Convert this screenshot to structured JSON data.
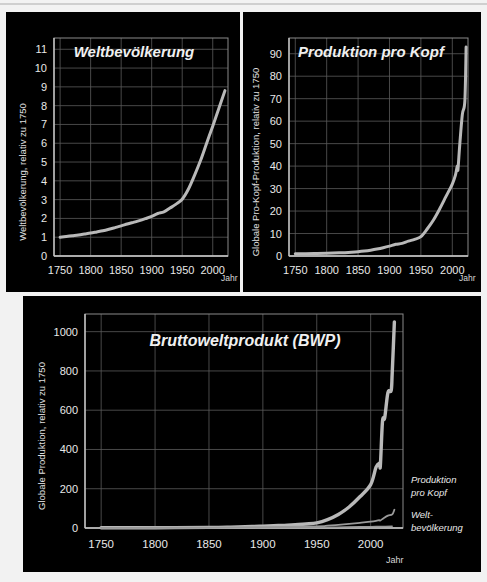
{
  "figure": {
    "background": "#f2f2f2",
    "panel_background": "#000000",
    "line_color": "#b9b9b9",
    "thin_line_color": "#9a9a9a",
    "grid_color": "#5a5a5a",
    "text_color": "#ececec"
  },
  "panels": {
    "population": {
      "title": "Weltbevölkerung",
      "ylabel": "Weltbevölkerung, relativ zu 1750",
      "xunit": "Jahr"
    },
    "per_capita": {
      "title": "Produktion pro Kopf",
      "ylabel": "Globale Pro-Kopf-Produktion, relativ zu 1750",
      "xunit": "Jahr"
    },
    "gwp": {
      "title": "Bruttoweltprodukt (BWP)",
      "ylabel": "Globale Produktion, relativ zu 1750",
      "xunit": "Jahr",
      "legend": [
        {
          "id": "per-capita",
          "line1": "Produktion",
          "line2": "pro Kopf"
        },
        {
          "id": "population",
          "line1": "Welt-",
          "line2": "bevölkerung"
        }
      ]
    }
  },
  "chart_data": [
    {
      "id": "weltbevoelkerung",
      "type": "line",
      "title": "Weltbevölkerung",
      "xlabel": "Jahr",
      "ylabel": "Weltbevölkerung, relativ zu 1750",
      "xlim": [
        1740,
        2025
      ],
      "ylim": [
        0,
        11.6
      ],
      "xticks": [
        1750,
        1800,
        1850,
        1900,
        1950,
        2000
      ],
      "yticks": [
        0,
        1,
        2,
        3,
        4,
        5,
        6,
        7,
        8,
        9,
        10,
        11
      ],
      "grid": true,
      "legend_position": "none",
      "series": [
        {
          "name": "Weltbevölkerung",
          "x": [
            1750,
            1760,
            1770,
            1780,
            1790,
            1800,
            1810,
            1820,
            1830,
            1840,
            1850,
            1860,
            1870,
            1880,
            1890,
            1900,
            1910,
            1920,
            1930,
            1940,
            1950,
            1960,
            1970,
            1980,
            1990,
            2000,
            2010,
            2020
          ],
          "values": [
            1.0,
            1.04,
            1.08,
            1.12,
            1.17,
            1.22,
            1.28,
            1.34,
            1.42,
            1.51,
            1.6,
            1.7,
            1.79,
            1.88,
            1.99,
            2.11,
            2.26,
            2.35,
            2.55,
            2.76,
            3.02,
            3.55,
            4.28,
            5.08,
            6.0,
            6.91,
            7.85,
            8.8
          ]
        }
      ]
    },
    {
      "id": "produktion-pro-kopf",
      "type": "line",
      "title": "Produktion pro Kopf",
      "xlabel": "Jahr",
      "ylabel": "Globale Pro-Kopf-Produktion, relativ zu 1750",
      "xlim": [
        1740,
        2025
      ],
      "ylim": [
        0,
        97
      ],
      "xticks": [
        1750,
        1800,
        1850,
        1900,
        1950,
        2000
      ],
      "yticks": [
        0,
        10,
        20,
        30,
        40,
        50,
        60,
        70,
        80,
        90
      ],
      "grid": true,
      "legend_position": "none",
      "series": [
        {
          "name": "Produktion pro Kopf",
          "x": [
            1750,
            1780,
            1800,
            1820,
            1840,
            1850,
            1860,
            1870,
            1880,
            1890,
            1900,
            1910,
            1920,
            1930,
            1940,
            1950,
            1960,
            1970,
            1980,
            1990,
            2000,
            2005,
            2008,
            2009,
            2012,
            2016,
            2020,
            2022
          ],
          "values": [
            1.0,
            1.1,
            1.2,
            1.4,
            1.7,
            1.9,
            2.2,
            2.6,
            3.1,
            3.7,
            4.4,
            5.2,
            5.6,
            6.6,
            7.4,
            8.6,
            12.0,
            16.0,
            21.0,
            26.5,
            32.0,
            36.0,
            40.0,
            38.5,
            50.0,
            63.0,
            69.0,
            93.0
          ]
        }
      ]
    },
    {
      "id": "bruttoweltprodukt",
      "type": "line",
      "title": "Bruttoweltprodukt (BWP)",
      "xlabel": "Jahr",
      "ylabel": "Globale Produktion, relativ zu 1750",
      "xlim": [
        1735,
        2030
      ],
      "ylim": [
        0,
        1090
      ],
      "xticks": [
        1750,
        1800,
        1850,
        1900,
        1950,
        2000
      ],
      "yticks": [
        0,
        200,
        400,
        600,
        800,
        1000
      ],
      "grid": true,
      "legend_position": "right",
      "series": [
        {
          "name": "Bruttoweltprodukt (BWP)",
          "x": [
            1750,
            1800,
            1850,
            1870,
            1890,
            1900,
            1910,
            1920,
            1930,
            1940,
            1950,
            1960,
            1970,
            1980,
            1990,
            2000,
            2005,
            2008,
            2009,
            2011,
            2013,
            2016,
            2019,
            2020,
            2022
          ],
          "values": [
            1,
            1.5,
            3.0,
            4.6,
            7.4,
            9.3,
            11.8,
            13.2,
            16.8,
            20.4,
            26.0,
            42.6,
            68.5,
            107,
            159,
            221,
            310,
            330,
            318,
            545,
            560,
            690,
            700,
            790,
            1050
          ]
        },
        {
          "name": "Produktion pro Kopf",
          "x": [
            1750,
            1800,
            1850,
            1900,
            1950,
            1960,
            1970,
            1980,
            1990,
            2000,
            2005,
            2008,
            2009,
            2012,
            2016,
            2020,
            2022
          ],
          "values": [
            1.0,
            1.2,
            1.9,
            4.4,
            8.6,
            12.0,
            16.0,
            21.0,
            26.5,
            32.0,
            36.0,
            40.0,
            38.5,
            50.0,
            63.0,
            69.0,
            93.0
          ]
        },
        {
          "name": "Weltbevölkerung",
          "x": [
            1750,
            1800,
            1850,
            1900,
            1950,
            1970,
            1990,
            2000,
            2010,
            2020
          ],
          "values": [
            1.0,
            1.22,
            1.6,
            2.11,
            3.02,
            4.28,
            6.0,
            6.91,
            7.85,
            8.8
          ]
        }
      ]
    }
  ]
}
